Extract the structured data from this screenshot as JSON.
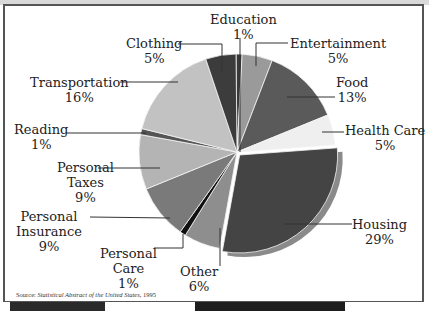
{
  "chart_data": {
    "type": "pie",
    "title": "",
    "categories": [
      "Education",
      "Entertainment",
      "Food",
      "Health Care",
      "Housing",
      "Other",
      "Personal Care",
      "Personal Insurance",
      "Personal Taxes",
      "Reading",
      "Transportation",
      "Clothing"
    ],
    "values": [
      1,
      5,
      13,
      5,
      29,
      6,
      1,
      9,
      9,
      1,
      16,
      5
    ],
    "unit": "%",
    "colors": [
      "#3a3a3a",
      "#9a9a9a",
      "#5a5a5a",
      "#efefef",
      "#444444",
      "#8e8e8e",
      "#111111",
      "#7a7a7a",
      "#b4b4b4",
      "#555555",
      "#c2c2c2",
      "#3c3c3c"
    ],
    "exploded": [
      "Housing"
    ],
    "legend": "none (direct labels with leader lines)",
    "source": "Source: Statistical Abstract of the United States, 1995"
  },
  "labels": {
    "education": {
      "name": "Education",
      "pct": "1%"
    },
    "entertainment": {
      "name": "Entertainment",
      "pct": "5%"
    },
    "food": {
      "name": "Food",
      "pct": "13%"
    },
    "health_care": {
      "name": "Health Care",
      "pct": "5%"
    },
    "housing": {
      "name": "Housing",
      "pct": "29%"
    },
    "other": {
      "name": "Other",
      "pct": "6%"
    },
    "personal_care": {
      "name1": "Personal",
      "name2": "Care",
      "pct": "1%"
    },
    "personal_insurance": {
      "name1": "Personal",
      "name2": "Insurance",
      "pct": "9%"
    },
    "personal_taxes": {
      "name1": "Personal",
      "name2": "Taxes",
      "pct": "9%"
    },
    "reading": {
      "name": "Reading",
      "pct": "1%"
    },
    "transportation": {
      "name": "Transportation",
      "pct": "16%"
    },
    "clothing": {
      "name": "Clothing",
      "pct": "5%"
    }
  },
  "source": {
    "prefix": "Source: ",
    "title": "Statistical Abstract of the United States",
    "suffix": ", 1995"
  }
}
